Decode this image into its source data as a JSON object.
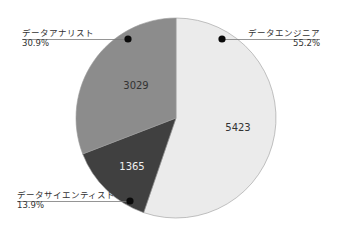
{
  "chart_data": {
    "type": "pie",
    "title": "",
    "categories": [
      "データエンジニア",
      "データサイエンティスト",
      "データアナリスト"
    ],
    "values": [
      5423,
      1365,
      3029
    ],
    "percentages": [
      "55.2%",
      "13.9%",
      "30.9%"
    ],
    "colors": [
      "#ebebeb",
      "#404040",
      "#8c8c8c"
    ],
    "start_angle": "12 o'clock, clockwise",
    "legend": "none (callout labels with leader lines)",
    "labels": {
      "engineer": {
        "name": "データエンジニア",
        "pct": "55.2%",
        "value": "5423"
      },
      "scientist": {
        "name": "データサイエンティスト",
        "pct": "13.9%",
        "value": "1365"
      },
      "analyst": {
        "name": "データアナリスト",
        "pct": "30.9%",
        "value": "3029"
      }
    }
  }
}
